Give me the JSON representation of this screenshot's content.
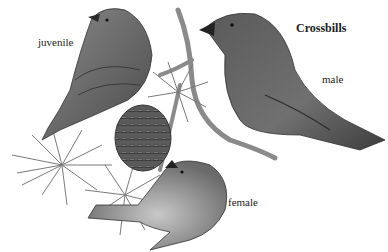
{
  "figure": {
    "title": "Crossbills",
    "labels": {
      "juvenile": "juvenile",
      "male": "male",
      "female": "female"
    },
    "colors": {
      "background": "#ffffff",
      "ink": "#222222",
      "bird_dark": "#3a3a3a",
      "bird_mid": "#6e6e6e",
      "bird_light": "#a8a8a8",
      "branch": "#8a8a8a",
      "cone": "#4a4a4a"
    }
  }
}
